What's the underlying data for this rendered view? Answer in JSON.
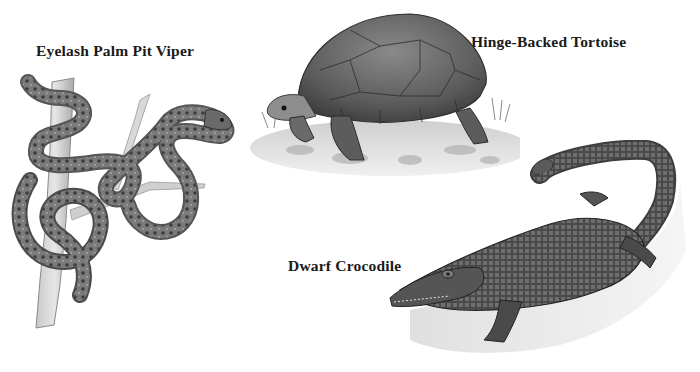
{
  "illustration": {
    "style": "grayscale pencil wildlife illustration",
    "background": "#ffffff",
    "labels": [
      {
        "id": "viper",
        "text": "Eyelash Palm Pit Viper"
      },
      {
        "id": "tortoise",
        "text": "Hinge-Backed Tortoise"
      },
      {
        "id": "crocodile",
        "text": "Dwarf Crocodile"
      }
    ],
    "animals": [
      {
        "name": "Eyelash Palm Pit Viper",
        "depiction": "snake coiled around a vertical branch"
      },
      {
        "name": "Hinge-Backed Tortoise",
        "depiction": "tortoise walking on rocky ground with grass"
      },
      {
        "name": "Dwarf Crocodile",
        "depiction": "crocodile crawling diagonally with curled tail"
      }
    ]
  }
}
